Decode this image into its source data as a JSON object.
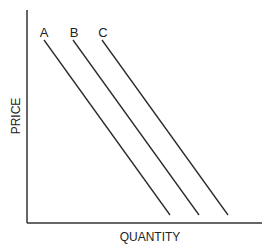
{
  "diagram": {
    "type": "supply-demand-curves",
    "x_axis_label": "QUANTITY",
    "y_axis_label": "PRICE",
    "curves": [
      {
        "label": "A",
        "x1": 44,
        "y1": 40,
        "x2": 170,
        "y2": 215
      },
      {
        "label": "B",
        "x1": 73,
        "y1": 40,
        "x2": 199,
        "y2": 215
      },
      {
        "label": "C",
        "x1": 102,
        "y1": 40,
        "x2": 228,
        "y2": 215
      }
    ],
    "colors": {
      "line": "#2a2a2a",
      "background": "#ffffff"
    }
  }
}
